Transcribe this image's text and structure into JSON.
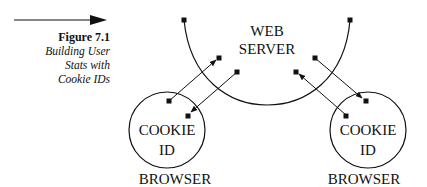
{
  "caption": {
    "figure_label": "Figure 7.1",
    "lines": [
      "Building User",
      "Stats with",
      "Cookie IDs"
    ]
  },
  "diagram": {
    "server_label": [
      "WEB",
      "SERVER"
    ],
    "left_browser": {
      "inner_label": [
        "COOKIE",
        "ID"
      ],
      "outer_label": "BROWSER"
    },
    "right_browser": {
      "inner_label": [
        "COOKIE",
        "ID"
      ],
      "outer_label": "BROWSER"
    }
  }
}
